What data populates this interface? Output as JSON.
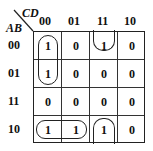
{
  "kmap": {
    "row_var": "AB",
    "col_var": "CD",
    "col_labels": [
      "00",
      "01",
      "11",
      "10"
    ],
    "row_labels": [
      "00",
      "01",
      "11",
      "10"
    ],
    "cells": [
      [
        "1",
        "0",
        "1",
        "0"
      ],
      [
        "1",
        "0",
        "0",
        "0"
      ],
      [
        "0",
        "0",
        "0",
        "0"
      ],
      [
        "1",
        "1",
        "1",
        "0"
      ]
    ],
    "groups": [
      {
        "name": "col00-rows00-01",
        "cells": [
          [
            0,
            0
          ],
          [
            1,
            0
          ]
        ]
      },
      {
        "name": "row10-cols00-01",
        "cells": [
          [
            3,
            0
          ],
          [
            3,
            1
          ]
        ]
      },
      {
        "name": "col11-wrap-rows00-10",
        "cells": [
          [
            0,
            2
          ],
          [
            3,
            2
          ]
        ]
      }
    ]
  }
}
